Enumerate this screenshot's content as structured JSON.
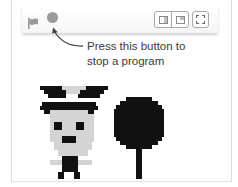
{
  "toolbar": {
    "green_flag_icon": "green-flag",
    "stop_icon": "stop-circle",
    "buttons": [
      {
        "name": "small-stage-button",
        "icon": "small-stage-icon"
      },
      {
        "name": "large-stage-button",
        "icon": "large-stage-icon"
      },
      {
        "name": "full-screen-button",
        "icon": "full-screen-icon"
      }
    ]
  },
  "callout": {
    "line1": "Press this button to",
    "line2": "stop a program"
  },
  "stage": {
    "sprites": [
      {
        "name": "character-sprite"
      },
      {
        "name": "tree-sprite"
      }
    ]
  },
  "colors": {
    "icon_gray": "#9a9a9a",
    "sprite_dark": "#111111",
    "sprite_light": "#d4d4d4",
    "text": "#3a3a3a"
  }
}
